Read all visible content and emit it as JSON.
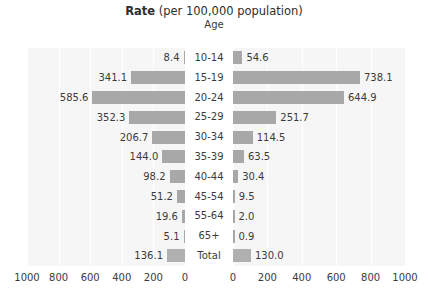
{
  "header": {
    "title_strong": "Rate",
    "title_rest": " (per 100,000 population)",
    "axis_title": "Age"
  },
  "colors": {
    "bar": "#a8a8a8",
    "panel_bg": "#f6f6f6",
    "gridline": "#ffffff",
    "text": "#3b3b3b"
  },
  "axis": {
    "left_ticks": [
      "1000",
      "800",
      "600",
      "400",
      "200",
      "0"
    ],
    "right_ticks": [
      "0",
      "200",
      "400",
      "600",
      "800",
      "1000"
    ],
    "max": 1000,
    "tick_step": 200
  },
  "chart_data": {
    "type": "bar",
    "title": "Rate (per 100,000 population)",
    "subtitle": "Age",
    "orientation": "horizontal",
    "layout": "population-pyramid",
    "xlabel": "Rate (per 100,000 population)",
    "ylabel": "Age",
    "xlim": [
      0,
      1000
    ],
    "grid": true,
    "legend_position": "none",
    "categories": [
      "10-14",
      "15-19",
      "20-24",
      "25-29",
      "30-34",
      "35-39",
      "40-44",
      "45-54",
      "55-64",
      "65+",
      "Total"
    ],
    "series": [
      {
        "name": "left",
        "side": "left",
        "values": [
          8.4,
          341.1,
          585.6,
          352.3,
          206.7,
          144.0,
          98.2,
          51.2,
          19.6,
          5.1,
          136.1
        ],
        "labels": [
          "8.4",
          "341.1",
          "585.6",
          "352.3",
          "206.7",
          "144.0",
          "98.2",
          "51.2",
          "19.6",
          "5.1",
          "136.1"
        ]
      },
      {
        "name": "right",
        "side": "right",
        "values": [
          54.6,
          738.1,
          644.9,
          251.7,
          114.5,
          63.5,
          30.4,
          9.5,
          2.0,
          0.9,
          130.0
        ],
        "labels": [
          "54.6",
          "738.1",
          "644.9",
          "251.7",
          "114.5",
          "63.5",
          "30.4",
          "9.5",
          "2.0",
          "0.9",
          "130.0"
        ]
      }
    ]
  }
}
